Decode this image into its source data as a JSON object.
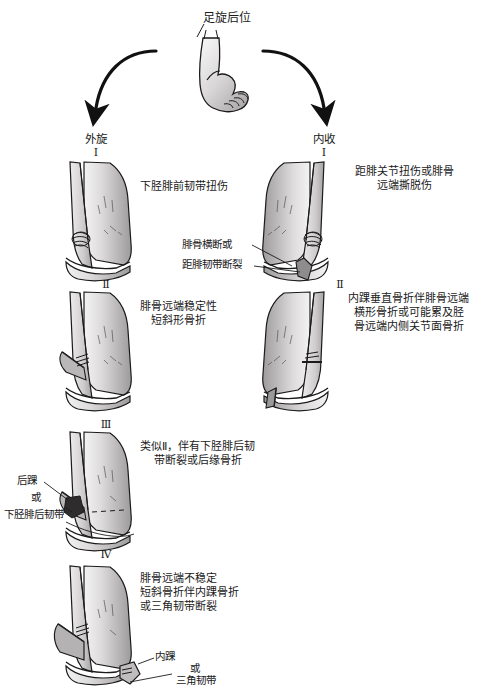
{
  "diagram": {
    "title": "足旋后位",
    "branches": [
      {
        "label": "外旋",
        "stage": "Ⅰ"
      },
      {
        "label": "内收",
        "stage": "Ⅰ"
      }
    ],
    "left_column": {
      "name": "外旋",
      "stages": [
        {
          "roman": "Ⅰ",
          "text": "下胫腓前韧带扭伤"
        },
        {
          "roman": "Ⅱ",
          "text": "腓骨远端稳定性\n短斜形骨折"
        },
        {
          "roman": "Ⅲ",
          "text": "类似Ⅱ，伴有下胫腓后韧\n带断裂或后缘骨折"
        },
        {
          "roman": "Ⅳ",
          "text": "腓骨远端不稳定\n短斜骨折伴内踝骨折\n或三角韧带断裂"
        }
      ]
    },
    "right_column": {
      "name": "内收",
      "stages": [
        {
          "roman": "Ⅰ",
          "text": "距腓关节扭伤或腓骨\n远端撕脱伤"
        },
        {
          "roman": "Ⅱ",
          "text": "内踝垂直骨折伴腓骨远端\n横形骨折或可能累及胫\n骨远端内侧关节面骨折"
        }
      ]
    },
    "callouts": [
      {
        "id": "callout-fibula-transverse",
        "text": "腓骨横断或"
      },
      {
        "id": "callout-talofibular-rupture",
        "text": "距腓韧带断裂"
      },
      {
        "id": "callout-posterior-malleolus",
        "text": "后踝"
      },
      {
        "id": "callout-or-1",
        "text": "或"
      },
      {
        "id": "callout-posterior-tibiofibular-ligament",
        "text": "下胫腓后韧带"
      },
      {
        "id": "callout-medial-malleolus",
        "text": "内踝"
      },
      {
        "id": "callout-or-2",
        "text": "或"
      },
      {
        "id": "callout-deltoid-ligament",
        "text": "三角韧带"
      }
    ],
    "colors": {
      "ink": "#1a1a1a",
      "bone_light": "#eceaea",
      "bone_mid": "#c9c7c7",
      "bone_dark": "#8e8c8c",
      "shadow": "#5b5959",
      "background": "#ffffff"
    }
  }
}
